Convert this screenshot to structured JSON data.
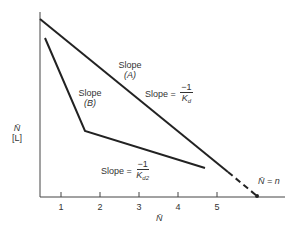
{
  "diagram": {
    "y_axis": {
      "label_top": "N̄",
      "label_bottom": "[L]"
    },
    "x_axis": {
      "label": "N̄",
      "ticks": [
        "1",
        "2",
        "3",
        "4",
        "5"
      ]
    },
    "line_a": {
      "label_line1": "Slope",
      "label_line2": "(A)"
    },
    "line_b": {
      "label_line1": "Slope",
      "label_line2": "(B)"
    },
    "slope_a_eq": {
      "prefix": "Slope =",
      "numerator": "−1",
      "denominator": "K",
      "denominator_sub": "d"
    },
    "slope_b_eq": {
      "prefix": "Slope =",
      "numerator": "−1",
      "denominator": "K",
      "denominator_sub": "d2"
    },
    "intercept_label": "N̄ = n",
    "colors": {
      "line": "#222222",
      "axis": "#444444"
    }
  }
}
